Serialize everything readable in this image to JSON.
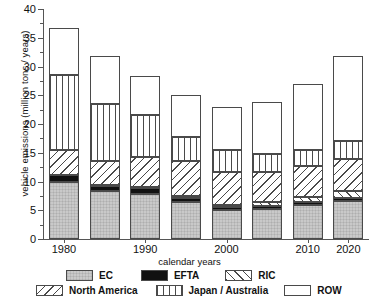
{
  "chart_data": {
    "type": "bar",
    "subtype": "stacked-bar",
    "title": "",
    "xlabel": "calendar years",
    "ylabel": "vehicle emissions (million tons / years)",
    "categories": [
      "1980",
      "1985",
      "1990",
      "1995",
      "2000",
      "2005",
      "2010",
      "2015"
    ],
    "tick_labels_shown": [
      "1980",
      "",
      "1990",
      "",
      "2000",
      "",
      "2010",
      "2020"
    ],
    "xtick_labels": [
      "1980",
      "1990",
      "2000",
      "2010",
      "2020"
    ],
    "ytick_labels": [
      "0",
      "5",
      "10",
      "15",
      "20",
      "25",
      "30",
      "35",
      "40"
    ],
    "ylim": [
      0,
      40
    ],
    "ystep": 5,
    "yminor_step": 2.5,
    "grid": false,
    "legend_position": "bottom",
    "series": [
      {
        "name": "EC",
        "values": [
          9.9,
          8.4,
          7.8,
          6.4,
          5.1,
          5.2,
          5.9,
          6.6
        ]
      },
      {
        "name": "EFTA",
        "values": [
          1.2,
          0.9,
          1.1,
          0.7,
          0.5,
          0.6,
          0.5,
          0.5
        ]
      },
      {
        "name": "RIC",
        "values": [
          0.1,
          0.1,
          0.2,
          0.3,
          0.4,
          0.6,
          0.9,
          1.3
        ]
      },
      {
        "name": "North America",
        "values": [
          4.2,
          4.1,
          5.2,
          6.1,
          5.7,
          5.2,
          5.4,
          5.6
        ]
      },
      {
        "name": "Japan / Australia",
        "values": [
          13.2,
          10.0,
          7.2,
          4.3,
          3.7,
          3.2,
          2.8,
          3.1
        ]
      },
      {
        "name": "ROW",
        "values": [
          8.1,
          8.4,
          6.8,
          7.2,
          7.5,
          9.1,
          11.5,
          14.8
        ]
      }
    ],
    "totals": [
      36.7,
      31.9,
      28.3,
      25.0,
      22.9,
      23.9,
      27.0,
      31.9
    ],
    "stack_order_bottom_to_top": [
      "EC",
      "EFTA",
      "RIC",
      "North America",
      "Japan / Australia",
      "ROW"
    ]
  },
  "legend": {
    "row1": [
      {
        "label": "EC",
        "pattern": "solid-gray"
      },
      {
        "label": "EFTA",
        "pattern": "solid-black"
      },
      {
        "label": "RIC",
        "pattern": "diagonal-forward-hatch"
      }
    ],
    "row2": [
      {
        "label": "North America",
        "pattern": "diagonal-back-hatch"
      },
      {
        "label": "Japan / Australia",
        "pattern": "vertical-lines"
      },
      {
        "label": "ROW",
        "pattern": "empty-white"
      }
    ]
  }
}
